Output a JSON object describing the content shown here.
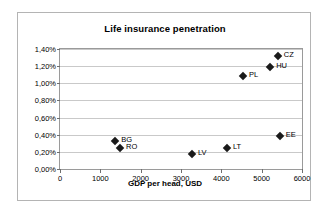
{
  "chart_data": {
    "type": "scatter",
    "title": "Life insurance penetration",
    "xlabel": "GDP per head, USD",
    "ylabel": "",
    "xlim": [
      0,
      6000
    ],
    "ylim": [
      0,
      1.4
    ],
    "grid": true,
    "legend": false,
    "x_ticks": [
      {
        "value": 0,
        "label": "0"
      },
      {
        "value": 1000,
        "label": "1000"
      },
      {
        "value": 2000,
        "label": "2000"
      },
      {
        "value": 3000,
        "label": "3000"
      },
      {
        "value": 4000,
        "label": "4000"
      },
      {
        "value": 5000,
        "label": "5000"
      },
      {
        "value": 6000,
        "label": "6000"
      }
    ],
    "y_ticks": [
      {
        "value": 0.0,
        "label": "0,00%"
      },
      {
        "value": 0.2,
        "label": "0,20%"
      },
      {
        "value": 0.4,
        "label": "0,40%"
      },
      {
        "value": 0.6,
        "label": "0,60%"
      },
      {
        "value": 0.8,
        "label": "0,80%"
      },
      {
        "value": 1.0,
        "label": "1,00%"
      },
      {
        "value": 1.2,
        "label": "1,20%"
      },
      {
        "value": 1.4,
        "label": "1,40%"
      }
    ],
    "points": [
      {
        "label": "BG",
        "x": 1370,
        "y": 0.33
      },
      {
        "label": "RO",
        "x": 1490,
        "y": 0.25
      },
      {
        "label": "LV",
        "x": 3270,
        "y": 0.18
      },
      {
        "label": "LT",
        "x": 4140,
        "y": 0.25
      },
      {
        "label": "EE",
        "x": 5450,
        "y": 0.39
      },
      {
        "label": "PL",
        "x": 4540,
        "y": 1.09
      },
      {
        "label": "HU",
        "x": 5210,
        "y": 1.19
      },
      {
        "label": "CZ",
        "x": 5400,
        "y": 1.32
      }
    ],
    "colors": {
      "marker": "#1a1a1a",
      "gridline": "#c9c9c9",
      "axis": "#9a9a9a",
      "frame": "#b4b4b4",
      "background": "#ffffff",
      "text": "#000000"
    }
  }
}
